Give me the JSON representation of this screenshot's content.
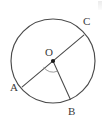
{
  "figure": {
    "type": "geometry-diagram",
    "width": 105,
    "height": 129,
    "background_color": "#ffffff",
    "stroke_color": "#4a4a4a",
    "label_color": "#3a3a3a",
    "circle": {
      "center_label": "O",
      "center_x": 53,
      "center_y": 61,
      "radius": 42
    },
    "center_dot": {
      "x": 53,
      "y": 61,
      "radius": 2.1,
      "color": "#1a1a1a"
    },
    "points": [
      {
        "name": "A",
        "label": "A",
        "x": 23.5,
        "y": 85.5,
        "label_x": 10,
        "label_y": 82
      },
      {
        "name": "B",
        "label": "B",
        "x": 70.0,
        "y": 99.5,
        "label_x": 68,
        "label_y": 106
      },
      {
        "name": "C",
        "label": "C",
        "x": 82.5,
        "y": 36.5,
        "label_x": 83,
        "label_y": 16
      },
      {
        "name": "O",
        "label": "O",
        "x": 53,
        "y": 61,
        "label_x": 45,
        "label_y": 47
      }
    ],
    "segments": [
      {
        "name": "diameter-AC",
        "from": "A",
        "to": "C",
        "kind": "diameter"
      },
      {
        "name": "radius-OB",
        "from": "O",
        "to": "B",
        "kind": "radius"
      }
    ],
    "angle_arc": {
      "name": "angle-AOB-arc",
      "at": "O",
      "between": [
        "A",
        "B"
      ],
      "radius": 11
    },
    "labels": {
      "A": "A",
      "B": "B",
      "C": "C",
      "O": "O"
    }
  }
}
